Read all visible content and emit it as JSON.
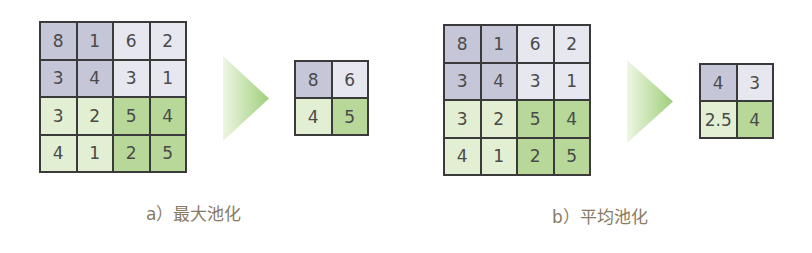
{
  "colors": {
    "quadrant_top_left": "#c5c7d9",
    "quadrant_top_right": "#e7e7ef",
    "quadrant_bottom_left": "#e3efd3",
    "quadrant_bottom_right": "#b7d898",
    "grid_line": "#3a3a3a",
    "caption": "#8a7a62",
    "arrow": "#9fcf7a"
  },
  "panels": [
    {
      "caption": "a）最大池化",
      "input": [
        [
          "8",
          "1",
          "6",
          "2"
        ],
        [
          "3",
          "4",
          "3",
          "1"
        ],
        [
          "3",
          "2",
          "5",
          "4"
        ],
        [
          "4",
          "1",
          "2",
          "5"
        ]
      ],
      "output": [
        [
          "8",
          "6"
        ],
        [
          "4",
          "5"
        ]
      ],
      "arrow_icon": "right-triangle-arrow"
    },
    {
      "caption": "b）平均池化",
      "input": [
        [
          "8",
          "1",
          "6",
          "2"
        ],
        [
          "3",
          "4",
          "3",
          "1"
        ],
        [
          "3",
          "2",
          "5",
          "4"
        ],
        [
          "4",
          "1",
          "2",
          "5"
        ]
      ],
      "output": [
        [
          "4",
          "3"
        ],
        [
          "2.5",
          "4"
        ]
      ],
      "arrow_icon": "right-triangle-arrow"
    }
  ]
}
